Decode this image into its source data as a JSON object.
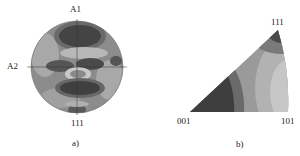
{
  "figure_a": {
    "caption": "a)",
    "type": "pole-figure",
    "top_axis_label": "A1",
    "left_axis_label": "A2",
    "bottom_label": "111"
  },
  "figure_b": {
    "caption": "b)",
    "type": "inverse-pole-figure",
    "apex_label": "111",
    "left_label": "001",
    "right_label": "101"
  },
  "colors": {
    "darkest": "#3a3a3a",
    "dark": "#555555",
    "mid": "#7a7a7a",
    "light": "#9a9a9a",
    "lighter": "#b5b5b5",
    "lightest": "#cfcfcf"
  }
}
